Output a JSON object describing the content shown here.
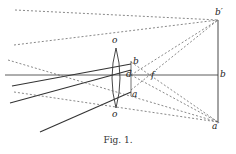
{
  "figure": {
    "caption": "Fig. 1.",
    "labels": {
      "lens_top": "o",
      "lens_bottom": "o",
      "object_top": "b",
      "object_mid": "d",
      "object_bottom": "a",
      "focus": "f",
      "image_top": "b′",
      "image_mid": "b",
      "image_bottom": "a′"
    }
  }
}
